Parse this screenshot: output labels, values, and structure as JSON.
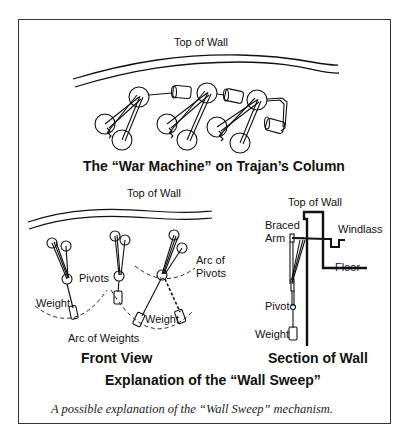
{
  "figure": {
    "top_diagram": {
      "top_of_wall_label": "Top of Wall",
      "title": "The “War Machine” on Trajan’s Column"
    },
    "front_view": {
      "top_of_wall_label": "Top of Wall",
      "pivots_label": "Pivots",
      "arc_of_pivots_label_line1": "Arc of",
      "arc_of_pivots_label_line2": "Pivots",
      "weight_label_left": "Weight",
      "weight_label_right": "Weight",
      "arc_of_weights_label": "Arc of Weights",
      "title": "Front View"
    },
    "section_view": {
      "top_of_wall_label": "Top of Wall",
      "braced_label": "Braced",
      "arm_label": "Arm",
      "windlass_label": "Windlass",
      "floor_label": "Floor",
      "pivot_label": "Pivot",
      "weight_label": "Weight",
      "title": "Section of Wall"
    },
    "bottom_title": "Explanation of the “Wall Sweep”",
    "caption": "A possible explanation of the “Wall Sweep” mechanism."
  }
}
